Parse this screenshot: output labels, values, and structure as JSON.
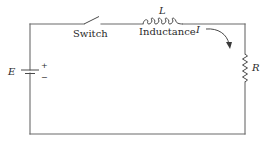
{
  "diagram": {
    "type": "circuit",
    "components": {
      "source": {
        "symbol": "E",
        "plus": "+",
        "minus": "−"
      },
      "switch": {
        "label": "Switch"
      },
      "inductor": {
        "symbol": "L",
        "label": "Inductance"
      },
      "resistor": {
        "symbol": "R"
      },
      "current": {
        "symbol": "I"
      }
    },
    "colors": {
      "wire": "#6a6a6a",
      "component": "#4a4a4a",
      "text": "#2a2a2a"
    }
  }
}
